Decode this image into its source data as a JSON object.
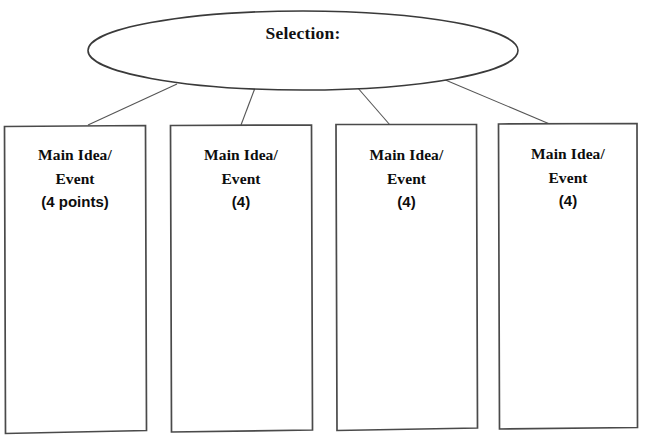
{
  "canvas": {
    "width": 649,
    "height": 447,
    "background": "#ffffff",
    "line_color": "#4a4a4a",
    "text_color": "#0d0d0d"
  },
  "organizer": {
    "topic": {
      "label": "Selection:",
      "shape": "ellipse"
    },
    "boxes": [
      {
        "line1": "Main Idea/",
        "line2": "Event",
        "line3": "(4 points)",
        "points": 4
      },
      {
        "line1": "Main Idea/",
        "line2": "Event",
        "line3": "(4)",
        "points": 4
      },
      {
        "line1": "Main Idea/",
        "line2": "Event",
        "line3": "(4)",
        "points": 4
      },
      {
        "line1": "Main Idea/",
        "line2": "Event",
        "line3": "(4)",
        "points": 4
      }
    ]
  }
}
